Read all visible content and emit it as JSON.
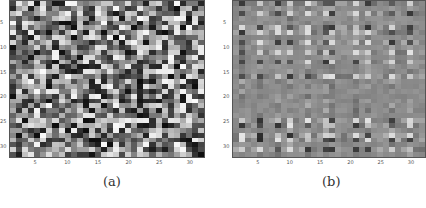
{
  "figure": {
    "panels": [
      {
        "id": "a",
        "caption": "(a)"
      },
      {
        "id": "b",
        "caption": "(b)"
      }
    ]
  },
  "chart_data": [
    {
      "type": "heatmap",
      "title": "(a)",
      "colormap": "gray",
      "grid_size": [
        32,
        32
      ],
      "xticks": [
        5,
        10,
        15,
        20,
        25,
        30
      ],
      "yticks": [
        5,
        10,
        15,
        20,
        25,
        30
      ],
      "xlim": [
        0.5,
        32.5
      ],
      "ylim": [
        0.5,
        32.5
      ],
      "description": "Random-looking grayscale matrix with high contrast, values spanning full range 0-1",
      "generator": {
        "kind": "random",
        "seed": 7,
        "min": 0.05,
        "max": 0.98
      }
    },
    {
      "type": "heatmap",
      "title": "(b)",
      "colormap": "gray",
      "grid_size": [
        32,
        32
      ],
      "xticks": [
        5,
        10,
        15,
        20,
        25,
        30
      ],
      "yticks": [
        5,
        10,
        15,
        20,
        25,
        30
      ],
      "xlim": [
        0.5,
        32.5
      ],
      "ylim": [
        0.5,
        32.5
      ],
      "description": "Low-contrast matrix centered on mid-gray with structured bright/dark cells along specific rows and columns",
      "generator": {
        "kind": "structured",
        "seed": 11,
        "base": 0.55,
        "noise": 0.04,
        "active_rows": [
          1,
          3,
          6,
          7,
          9,
          11,
          13,
          16,
          25,
          26,
          28,
          29,
          31
        ],
        "active_cols": [
          2,
          5,
          8,
          10,
          13,
          16,
          17,
          21,
          23,
          27,
          30
        ],
        "strength": 0.35
      }
    }
  ]
}
